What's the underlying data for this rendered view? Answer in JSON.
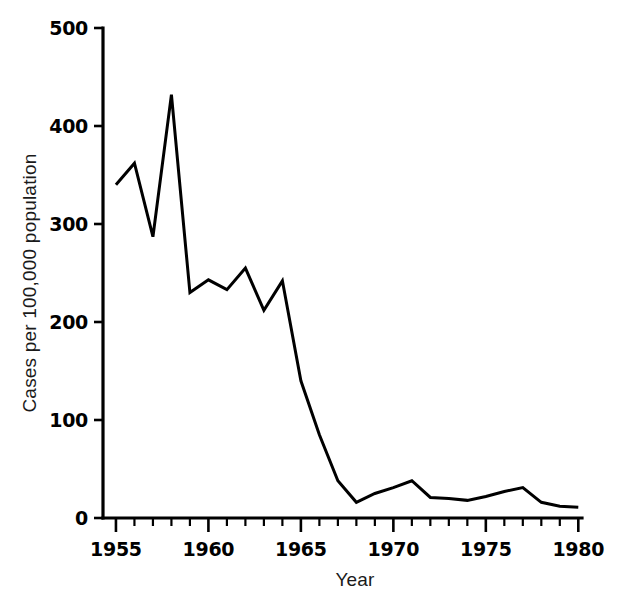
{
  "chart_data": {
    "type": "line",
    "title": "",
    "subtitle": "",
    "xlabel": "Year",
    "ylabel": "Cases per 100,000 population",
    "xlim": [
      1954.3,
      1980.2
    ],
    "ylim": [
      0,
      500
    ],
    "grid": false,
    "legend": false,
    "legend_position": "none",
    "x_ticks_major": [
      1955,
      1960,
      1965,
      1970,
      1975,
      1980
    ],
    "x_tick_labels": [
      "1955",
      "1960",
      "1965",
      "1970",
      "1975",
      "1980"
    ],
    "x_minor_tick_interval": 1,
    "y_ticks": [
      0,
      100,
      200,
      300,
      400,
      500
    ],
    "y_tick_labels": [
      "0",
      "100",
      "200",
      "300",
      "400",
      "500"
    ],
    "line_color": "#000000",
    "series": [
      {
        "name": "Cases per 100,000 population",
        "x": [
          1955,
          1956,
          1957,
          1958,
          1959,
          1960,
          1961,
          1962,
          1963,
          1964,
          1965,
          1966,
          1967,
          1968,
          1969,
          1970,
          1971,
          1972,
          1973,
          1974,
          1975,
          1976,
          1977,
          1978,
          1979,
          1980
        ],
        "values": [
          340,
          362,
          287,
          432,
          230,
          243,
          233,
          255,
          212,
          242,
          140,
          85,
          38,
          16,
          25,
          31,
          38,
          21,
          20,
          18,
          22,
          27,
          31,
          16,
          12,
          11
        ]
      }
    ],
    "annotations": []
  },
  "figure": {
    "background_color": "#ffffff",
    "foreground_color": "#000000"
  }
}
